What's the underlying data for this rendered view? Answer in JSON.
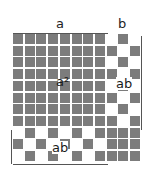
{
  "labels": {
    "top_a": "a",
    "top_b": "b",
    "center": "a²",
    "right_strip": "ab",
    "bottom_strip": "ab"
  },
  "grid": {
    "columns": 11,
    "rows": 11,
    "a_units": 8,
    "b_units": 3,
    "cell_color": "#7c7c7c",
    "gap_color": "#ffffff"
  }
}
